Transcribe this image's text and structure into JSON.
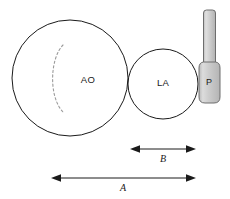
{
  "diagram": {
    "type": "anatomical-schematic",
    "background_color": "#ffffff",
    "outline_color": "#1a1a1a",
    "probe_fill_color": "#c9c9c9",
    "probe_stroke_color": "#6e6e6e",
    "valve_arc_color": "#9a9a9a",
    "structures": [
      {
        "id": "aorta",
        "label": "AO",
        "shape": "circle",
        "center_x": 70,
        "center_y": 78,
        "radius": 58,
        "label_x": 88,
        "label_y": 80
      },
      {
        "id": "left-atrium",
        "label": "LA",
        "shape": "circle",
        "center_x": 163,
        "center_y": 84,
        "radius": 35,
        "label_x": 163,
        "label_y": 83
      },
      {
        "id": "probe",
        "label": "P",
        "shape": "probe",
        "label_x": 209,
        "label_y": 83
      }
    ],
    "valve_arc": {
      "id": "valve-leaflet",
      "style": "dashed",
      "start_x": 63,
      "start_y": 45,
      "end_x": 64,
      "end_y": 113
    },
    "dimensions": [
      {
        "id": "dimension-b",
        "label": "B",
        "x1": 130,
        "x2": 196,
        "y": 149,
        "label_x": 163,
        "label_y": 160
      },
      {
        "id": "dimension-a",
        "label": "A",
        "x1": 51,
        "x2": 196,
        "y": 178,
        "label_x": 123,
        "label_y": 189
      }
    ]
  }
}
